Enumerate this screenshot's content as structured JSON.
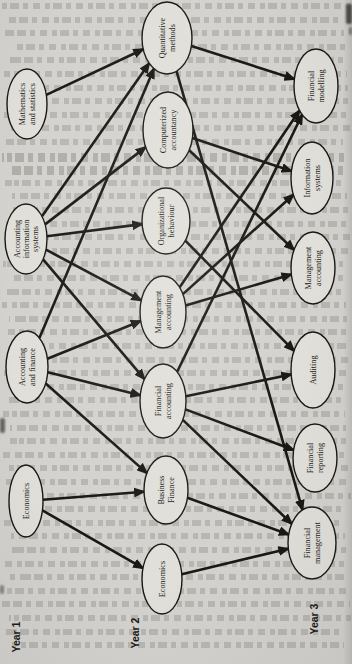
{
  "page": {
    "paper_color": "#d3d2ce",
    "ink_color": "#191813",
    "ellipse_fill": "#e0dfda"
  },
  "diagram": {
    "year_labels": [
      {
        "text": "Year 1",
        "cx": 16,
        "cy": 637
      },
      {
        "text": "Year 2",
        "cx": 135,
        "cy": 633
      },
      {
        "text": "Year 3",
        "cx": 314,
        "cy": 619
      }
    ],
    "nodes": [
      {
        "id": "ms",
        "year": 1,
        "label": [
          "Mathematics",
          "and statistics"
        ],
        "cx": 27,
        "cy": 104,
        "rx": 20,
        "ry": 35
      },
      {
        "id": "ais",
        "year": 1,
        "label": [
          "Accounting",
          "information",
          "systems"
        ],
        "cx": 26,
        "cy": 239,
        "rx": 21,
        "ry": 35
      },
      {
        "id": "af",
        "year": 1,
        "label": [
          "Accounting",
          "and finance"
        ],
        "cx": 27,
        "cy": 367,
        "rx": 21,
        "ry": 36
      },
      {
        "id": "e1",
        "year": 1,
        "label": [
          "Economics"
        ],
        "cx": 26,
        "cy": 501,
        "rx": 17,
        "ry": 36
      },
      {
        "id": "qm",
        "year": 2,
        "label": [
          "Quantitative",
          "methods"
        ],
        "cx": 167,
        "cy": 38,
        "rx": 25,
        "ry": 36
      },
      {
        "id": "ca",
        "year": 2,
        "label": [
          "Computerized",
          "accountancy"
        ],
        "cx": 168,
        "cy": 130,
        "rx": 25,
        "ry": 38
      },
      {
        "id": "ob",
        "year": 2,
        "label": [
          "Organizational",
          "behaviour"
        ],
        "cx": 166,
        "cy": 221,
        "rx": 24,
        "ry": 33
      },
      {
        "id": "ma2",
        "year": 2,
        "label": [
          "Management",
          "accounting"
        ],
        "cx": 163,
        "cy": 312,
        "rx": 23,
        "ry": 36
      },
      {
        "id": "fa",
        "year": 2,
        "label": [
          "Financial",
          "accounting"
        ],
        "cx": 163,
        "cy": 401,
        "rx": 23,
        "ry": 37
      },
      {
        "id": "bf",
        "year": 2,
        "label": [
          "Business",
          "Finance"
        ],
        "cx": 166,
        "cy": 490,
        "rx": 22,
        "ry": 34
      },
      {
        "id": "e2",
        "year": 2,
        "label": [
          "Economics"
        ],
        "cx": 162,
        "cy": 579,
        "rx": 20,
        "ry": 35
      },
      {
        "id": "fm",
        "year": 3,
        "label": [
          "Financial",
          "modelling"
        ],
        "cx": 316,
        "cy": 86,
        "rx": 22,
        "ry": 37
      },
      {
        "id": "is",
        "year": 3,
        "label": [
          "Information",
          "systems"
        ],
        "cx": 312,
        "cy": 178,
        "rx": 21,
        "ry": 36
      },
      {
        "id": "ma3",
        "year": 3,
        "label": [
          "Management",
          "accounting"
        ],
        "cx": 313,
        "cy": 268,
        "rx": 22,
        "ry": 36
      },
      {
        "id": "au",
        "year": 3,
        "label": [
          "Auditing"
        ],
        "cx": 313,
        "cy": 370,
        "rx": 22,
        "ry": 38
      },
      {
        "id": "fr",
        "year": 3,
        "label": [
          "Financial",
          "reporting"
        ],
        "cx": 315,
        "cy": 458,
        "rx": 22,
        "ry": 34
      },
      {
        "id": "fmg",
        "year": 3,
        "label": [
          "Financial",
          "management"
        ],
        "cx": 312,
        "cy": 543,
        "rx": 24,
        "ry": 36
      }
    ],
    "edges": [
      [
        "ms",
        "qm"
      ],
      [
        "ais",
        "qm"
      ],
      [
        "ais",
        "ca"
      ],
      [
        "ais",
        "ob"
      ],
      [
        "ais",
        "ma2"
      ],
      [
        "ais",
        "fa"
      ],
      [
        "af",
        "qm"
      ],
      [
        "af",
        "ma2"
      ],
      [
        "af",
        "fa"
      ],
      [
        "af",
        "bf"
      ],
      [
        "e1",
        "bf"
      ],
      [
        "e1",
        "e2"
      ],
      [
        "qm",
        "fm"
      ],
      [
        "qm",
        "fmg"
      ],
      [
        "ca",
        "is"
      ],
      [
        "ca",
        "ma3"
      ],
      [
        "ob",
        "au"
      ],
      [
        "ma2",
        "fm"
      ],
      [
        "ma2",
        "is"
      ],
      [
        "ma2",
        "ma3"
      ],
      [
        "fa",
        "fm"
      ],
      [
        "fa",
        "au"
      ],
      [
        "fa",
        "fr"
      ],
      [
        "fa",
        "fmg"
      ],
      [
        "bf",
        "fmg"
      ],
      [
        "e2",
        "fmg"
      ]
    ]
  }
}
